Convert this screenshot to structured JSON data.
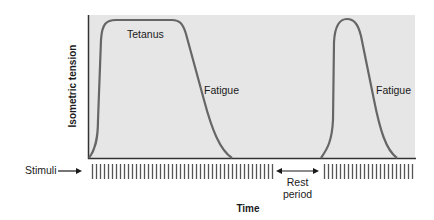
{
  "colors": {
    "plot_bg": "#e6e6e6",
    "curve": "#666666",
    "axis": "#333333",
    "stimuli": "#555555",
    "text": "#1a1a1a"
  },
  "axes": {
    "ylabel": "Isometric tension",
    "xlabel": "Time"
  },
  "annotations": {
    "tetanus": "Tetanus",
    "fatigue_1": "Fatigue",
    "fatigue_2": "Fatigue",
    "rest_line1": "Rest",
    "rest_line2": "period",
    "stimuli": "Stimuli"
  },
  "stimuli_blocks": [
    {
      "x_start": 92,
      "x_end": 272,
      "spacing": 4
    },
    {
      "x_start": 324,
      "x_end": 412,
      "spacing": 4
    }
  ],
  "curves": [
    {
      "name": "first-contraction",
      "phases": [
        "rise",
        "tetanus plateau",
        "fatigue decline"
      ]
    },
    {
      "name": "second-contraction",
      "phases": [
        "rise",
        "brief peak",
        "fatigue decline"
      ]
    }
  ]
}
